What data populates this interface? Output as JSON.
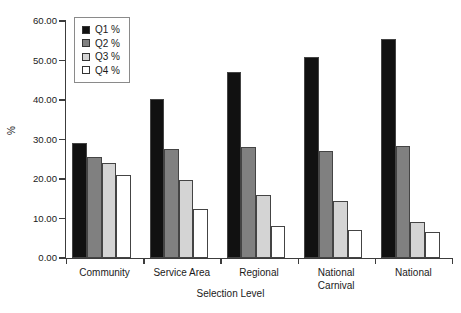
{
  "chart_data": {
    "type": "bar",
    "title": "",
    "xlabel": "Selection Level",
    "ylabel": "%",
    "categories": [
      "Community",
      "Service Area",
      "Regional",
      "National Carnival",
      "National"
    ],
    "series": [
      {
        "name": "Q1 %",
        "color": "#111111",
        "values": [
          29.0,
          40.2,
          47.0,
          51.0,
          55.5
        ]
      },
      {
        "name": "Q2 %",
        "color": "#808080",
        "values": [
          25.6,
          27.5,
          28.0,
          27.0,
          28.3
        ]
      },
      {
        "name": "Q3 %",
        "color": "#d4d4d4",
        "values": [
          24.0,
          19.8,
          16.0,
          14.4,
          9.2
        ]
      },
      {
        "name": "Q4 %",
        "color": "#ffffff",
        "values": [
          21.0,
          12.4,
          8.1,
          7.0,
          6.7
        ]
      }
    ],
    "ylim": [
      0,
      60
    ],
    "yticks": [
      0,
      10,
      20,
      30,
      40,
      50,
      60
    ],
    "ytick_labels": [
      "0.00",
      "10.00",
      "20.00",
      "30.00",
      "40.00",
      "50.00",
      "60.00"
    ],
    "grid": false,
    "legend_position": "top-left",
    "legend_entries": [
      "Q1 %",
      "Q2 %",
      "Q3 %",
      "Q4 %"
    ],
    "background": "#ffffff",
    "axis_color": "#3c3c3c"
  }
}
